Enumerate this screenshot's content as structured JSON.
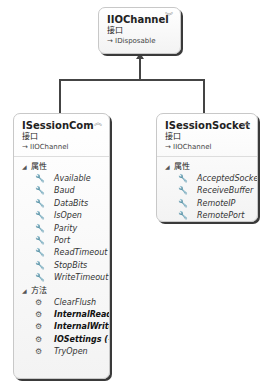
{
  "top_box": {
    "title": "IIOChannel",
    "stereotype": "接口",
    "base": "→ IDisposable",
    "collapse_icon": "double-chevron-down"
  },
  "left_box": {
    "title": "ISessionCom",
    "stereotype": "接口",
    "base": "→ IIOChannel",
    "collapse_icon": "double-chevron-up",
    "properties_label": "属性",
    "properties": [
      "Available",
      "Baud",
      "DataBits",
      "IsOpen",
      "Parity",
      "Port",
      "ReadTimeout",
      "StopBits",
      "WriteTimeout"
    ],
    "methods_label": "方法",
    "methods": [
      {
        "name": "ClearFlush",
        "bold": false
      },
      {
        "name": "InternalRead (+...",
        "bold": true
      },
      {
        "name": "InternalWrite (...",
        "bold": true
      },
      {
        "name": "IOSettings (+ 1 ...",
        "bold": true
      },
      {
        "name": "TryOpen",
        "bold": false
      }
    ]
  },
  "right_box": {
    "title": "ISessionSocket",
    "stereotype": "接口",
    "base": "→ IIOChannel",
    "collapse_icon": "double-chevron-up",
    "properties_label": "属性",
    "properties": [
      "AcceptedSocket",
      "ReceiveBuffer",
      "RemoteIP",
      "RemotePort"
    ]
  },
  "icons": {
    "property": "wrench",
    "method": "gear",
    "collapse_up": "︽",
    "collapse_down": "︾",
    "section": "◢"
  }
}
